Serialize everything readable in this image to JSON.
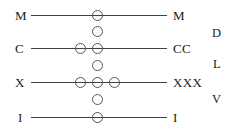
{
  "diagram": {
    "canvas": {
      "width": 243,
      "height": 139
    },
    "colors": {
      "background": "#ffffff",
      "wire": "#404048",
      "bead_outline": "#555560",
      "text": "#1b1b20"
    },
    "rows": [
      {
        "id": "row-m",
        "left_label": "M",
        "right_label": "M",
        "wire": {
          "x1": 31,
          "x2": 167,
          "y": 15
        },
        "beads_on_wire": [
          {
            "cx": 97,
            "cy": 15
          }
        ],
        "bead_count": 1
      },
      {
        "id": "row-c",
        "left_label": "C",
        "right_label": "CC",
        "wire": {
          "x1": 31,
          "x2": 167,
          "y": 48
        },
        "beads_on_wire": [
          {
            "cx": 80,
            "cy": 48
          },
          {
            "cx": 97,
            "cy": 48
          }
        ],
        "bead_count": 2
      },
      {
        "id": "row-x",
        "left_label": "X",
        "right_label": "XXX",
        "wire": {
          "x1": 31,
          "x2": 167,
          "y": 82
        },
        "beads_on_wire": [
          {
            "cx": 80,
            "cy": 82
          },
          {
            "cx": 97,
            "cy": 82
          },
          {
            "cx": 114,
            "cy": 82
          }
        ],
        "bead_count": 3
      },
      {
        "id": "row-i",
        "left_label": "I",
        "right_label": "I",
        "wire": {
          "x1": 31,
          "x2": 167,
          "y": 117
        },
        "beads_on_wire": [
          {
            "cx": 97,
            "cy": 117
          }
        ],
        "bead_count": 1
      }
    ],
    "upper_beads": [
      {
        "id": "upper-bead-d",
        "cx": 97,
        "cy": 31,
        "side_label": "D",
        "side_label_x": 212,
        "side_label_y": 27
      },
      {
        "id": "upper-bead-l",
        "cx": 97,
        "cy": 65,
        "side_label": "L",
        "side_label_x": 213,
        "side_label_y": 58
      },
      {
        "id": "upper-bead-v",
        "cx": 97,
        "cy": 99,
        "side_label": "V",
        "side_label_x": 212,
        "side_label_y": 93
      }
    ],
    "left_labels": [
      {
        "text": "M",
        "x": 15,
        "y": 9
      },
      {
        "text": "C",
        "x": 15,
        "y": 42
      },
      {
        "text": "X",
        "x": 15,
        "y": 76
      },
      {
        "text": "I",
        "x": 18,
        "y": 111
      }
    ],
    "right_labels": [
      {
        "text": "M",
        "x": 173,
        "y": 9
      },
      {
        "text": "CC",
        "x": 173,
        "y": 42
      },
      {
        "text": "XXX",
        "x": 173,
        "y": 76
      },
      {
        "text": "I",
        "x": 173,
        "y": 111
      }
    ],
    "side_labels": [
      {
        "text": "D",
        "x": 212,
        "y": 27
      },
      {
        "text": "L",
        "x": 213,
        "y": 58
      },
      {
        "text": "V",
        "x": 212,
        "y": 93
      }
    ]
  }
}
